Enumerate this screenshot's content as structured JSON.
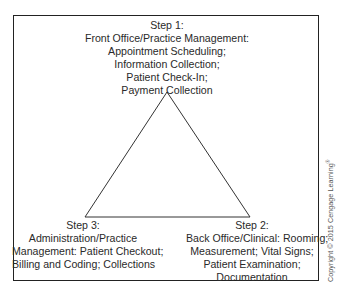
{
  "diagram": {
    "type": "cycle-triangle",
    "steps": [
      {
        "id": "step1",
        "position": "top",
        "lines": [
          "Step 1:",
          "Front Office/Practice Management:",
          "Appointment Scheduling;",
          "Information Collection;",
          "Patient Check-In;",
          "Payment Collection"
        ]
      },
      {
        "id": "step2",
        "position": "bottom-right",
        "lines": [
          "Step 2:",
          "Back Office/Clinical: Rooming;",
          "Measurement; Vital Signs;",
          "Patient Examination;",
          "Documentation"
        ]
      },
      {
        "id": "step3",
        "position": "bottom-left",
        "lines": [
          "Step 3:",
          "Administration/Practice",
          "Management: Patient Checkout;",
          "Billing and Coding; Collections"
        ]
      }
    ],
    "triangle": {
      "apex": [
        167,
        92
      ],
      "bottom_left": [
        85,
        217
      ],
      "bottom_right": [
        250,
        217
      ],
      "stroke": "#333333"
    },
    "frame_color": "#222222"
  },
  "copyright": {
    "text": "Copyright © 2015 Cengage Learning",
    "mark": "®"
  }
}
